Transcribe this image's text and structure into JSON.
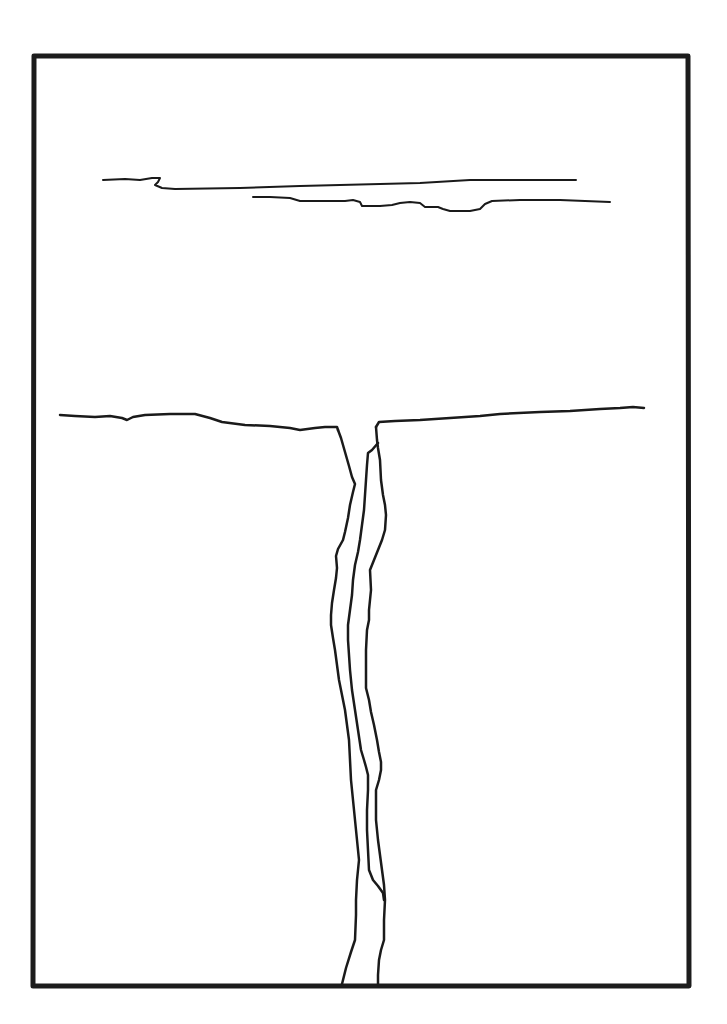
{
  "drawing": {
    "background": "#ffffff",
    "ink_color": "#1a1a1a",
    "frame_color": "#1c1c1c",
    "frame": {
      "points": "34,56 688,56 689,986 33,986",
      "stroke_width": 5
    },
    "elements": [
      {
        "name": "cloud-upper-stroke",
        "width": 2,
        "d": "M103,180 L125,179 L140,180 L152,178 L160,178 L158,182 L155,185 L162,188 L175,189 L240,188 L300,186 L380,184 L420,183 L470,180 L520,180 L576,180"
      },
      {
        "name": "cloud-lower-stroke",
        "width": 2,
        "d": "M253,197 L270,197 L290,198 L300,201 L320,201 L345,201 L353,200 L360,202 L362,206 L380,206 L392,205 L400,203 L410,202 L420,203 L425,207 L438,207 L443,209 L450,211 L470,211 L480,209 L485,204 L492,201 L520,200 L560,200 L610,202"
      },
      {
        "name": "horizon-left",
        "width": 2.5,
        "d": "M60,415 L75,416 L95,417 L110,416 L122,418 L127,420 L133,417 L145,415 L170,414 L195,414 L210,418 L222,422 L245,425 L270,426 L290,428 L300,430 L315,428 L325,427 L337,427 L338,430"
      },
      {
        "name": "horizon-right",
        "width": 2.5,
        "d": "M376,427 L379,422 L395,421 L420,420 L450,418 L480,416 L500,414 L540,412 L570,411 L600,409 L620,408 L633,407 L644,408"
      },
      {
        "name": "crevasse-left-wall",
        "width": 2.5,
        "d": "M338,430 L341,438 L345,452 L349,466 L352,477 L355,484 L353,492 L350,505 L348,518 L345,532 L343,540 L338,549 L336,556 L337,568 L336,578 L334,590 L332,603 L331,615 L331,625 L333,638 L335,650 L337,665 L339,680 L342,695 L345,710 L347,725 L349,740 L350,760 L351,780 L353,800 L355,820 L357,840 L359,860 L357,880 L356,900 L356,915 L355,940 L351,952 L346,968 L342,984"
      },
      {
        "name": "crevasse-inner-line",
        "width": 2.5,
        "d": "M378,443 L372,450 L368,453 L367,465 L366,480 L365,495 L364,510 L362,525 L360,540 L358,552 L355,565 L353,580 L352,595 L350,610 L348,625 L348,640 L349,655 L350,670 L352,690 L355,710 L358,730 L361,750 L364,760 L366,767 L368,775 L368,790 L367,810 L367,830 L368,850 L369,870 L373,880 L378,886 L383,893 L384,900"
      },
      {
        "name": "crevasse-right-wall",
        "width": 2.5,
        "d": "M376,427 L377,440 L378,448 L380,460 L381,480 L383,495 L385,505 L386,515 L385,530 L382,540 L378,550 L374,560 L370,570 L371,590 L369,610 L369,620 L367,630 L366,650 L366,670 L366,688 L369,700 L371,712 L374,725 L377,740 L379,752 L381,762 L381,770 L379,780 L376,790 L376,800 L376,820 L378,840 L380,855 L382,870 L384,885 L385,900 L384,920 L384,940 L381,950 L379,960 L378,975 L378,984"
      }
    ]
  }
}
